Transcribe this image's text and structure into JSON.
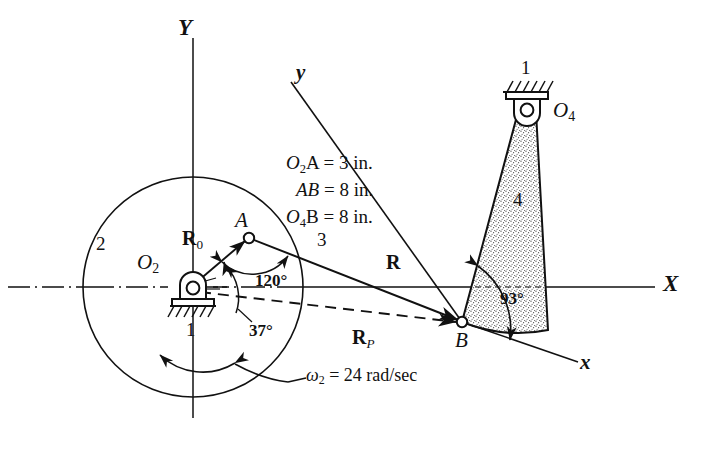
{
  "figure": {
    "type": "kinematic-linkage-diagram",
    "background_color": "#ffffff",
    "line_color": "#111111",
    "link4_fill": "#efefef"
  },
  "axes": {
    "global_y_label": "Y",
    "global_x_label": "X",
    "frame_y_label": "y",
    "frame_x_label": "x"
  },
  "dimensions": {
    "line1_name": "O",
    "line1_sub": "2",
    "line1_rest": "A = 3 in.",
    "line2_name": "AB",
    "line2_rest": " = 8 in.",
    "line3_name": "O",
    "line3_sub": "4",
    "line3_rest": "B = 8 in.",
    "text_line_1": "O₂A = 3 in.",
    "text_line_2": "AB = 8 in.",
    "text_line_3": "O₄B = 8 in."
  },
  "joints": {
    "o2_label": "O",
    "o2_sub": "2",
    "o4_label": "O",
    "o4_sub": "4",
    "a_label": "A",
    "b_label": "B"
  },
  "links": {
    "ground_lower": "1",
    "ground_upper": "1",
    "crank": "2",
    "coupler": "3",
    "rocker": "4"
  },
  "vectors": {
    "r0_main": "R",
    "r0_sub": "0",
    "r_main": "R",
    "rp_main": "R",
    "rp_sub": "P"
  },
  "angles": {
    "theta_120": "120°",
    "theta_37": "37°",
    "theta_93": "93°"
  },
  "velocity": {
    "symbol": "ω",
    "symbol_sub": "2",
    "equals_value": " = 24 rad/sec",
    "full_text": "ω₂ = 24 rad/sec"
  }
}
